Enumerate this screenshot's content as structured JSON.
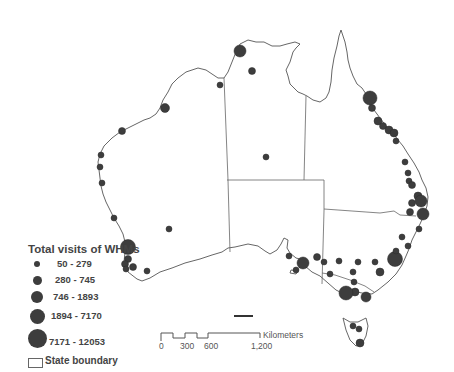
{
  "map": {
    "region": "Australia",
    "colors": {
      "symbol": "#3d3d3d",
      "outline": "#555555",
      "background": "#ffffff"
    }
  },
  "legend": {
    "title": "Total visits of WHMs",
    "classes": [
      {
        "label": "50 - 279",
        "size": 6
      },
      {
        "label": "280 - 745",
        "size": 9
      },
      {
        "label": "746 - 1893",
        "size": 12
      },
      {
        "label": "1894 - 7170",
        "size": 15
      },
      {
        "label": "7171 - 12053",
        "size": 19
      }
    ],
    "state_boundary_label": "State boundary"
  },
  "scale_bar": {
    "unit": "Kilometers",
    "ticks": [
      "0",
      "300",
      "600",
      "1,200"
    ]
  },
  "points": [
    {
      "x": 240,
      "y": 51,
      "r": 6
    },
    {
      "x": 252,
      "y": 71,
      "r": 3.5
    },
    {
      "x": 220,
      "y": 85,
      "r": 3
    },
    {
      "x": 165,
      "y": 108,
      "r": 4.5
    },
    {
      "x": 122,
      "y": 131,
      "r": 3.5
    },
    {
      "x": 101,
      "y": 155,
      "r": 3
    },
    {
      "x": 100,
      "y": 167,
      "r": 3
    },
    {
      "x": 102,
      "y": 183,
      "r": 3
    },
    {
      "x": 114,
      "y": 218,
      "r": 3
    },
    {
      "x": 169,
      "y": 229,
      "r": 3
    },
    {
      "x": 128,
      "y": 247,
      "r": 7.5
    },
    {
      "x": 128,
      "y": 259,
      "r": 3.5
    },
    {
      "x": 125,
      "y": 264,
      "r": 3.5
    },
    {
      "x": 133,
      "y": 267,
      "r": 3.5
    },
    {
      "x": 126,
      "y": 269,
      "r": 3
    },
    {
      "x": 147,
      "y": 271,
      "r": 3
    },
    {
      "x": 266,
      "y": 157,
      "r": 3
    },
    {
      "x": 370,
      "y": 98,
      "r": 7
    },
    {
      "x": 372,
      "y": 108,
      "r": 3.5
    },
    {
      "x": 378,
      "y": 121,
      "r": 4
    },
    {
      "x": 383,
      "y": 126,
      "r": 3.5
    },
    {
      "x": 389,
      "y": 130,
      "r": 4
    },
    {
      "x": 394,
      "y": 133,
      "r": 4
    },
    {
      "x": 396,
      "y": 141,
      "r": 3
    },
    {
      "x": 405,
      "y": 162,
      "r": 3
    },
    {
      "x": 408,
      "y": 173,
      "r": 3
    },
    {
      "x": 409,
      "y": 181,
      "r": 3
    },
    {
      "x": 412,
      "y": 185,
      "r": 3.5
    },
    {
      "x": 418,
      "y": 196,
      "r": 4
    },
    {
      "x": 421,
      "y": 201,
      "r": 6
    },
    {
      "x": 412,
      "y": 203,
      "r": 3.5
    },
    {
      "x": 423,
      "y": 214,
      "r": 6
    },
    {
      "x": 410,
      "y": 212,
      "r": 3.5
    },
    {
      "x": 419,
      "y": 229,
      "r": 3
    },
    {
      "x": 402,
      "y": 237,
      "r": 3
    },
    {
      "x": 408,
      "y": 246,
      "r": 3
    },
    {
      "x": 303,
      "y": 263,
      "r": 6
    },
    {
      "x": 296,
      "y": 270,
      "r": 3
    },
    {
      "x": 289,
      "y": 256,
      "r": 3
    },
    {
      "x": 317,
      "y": 257,
      "r": 3.5
    },
    {
      "x": 324,
      "y": 262,
      "r": 3
    },
    {
      "x": 339,
      "y": 261,
      "r": 3
    },
    {
      "x": 330,
      "y": 274,
      "r": 3
    },
    {
      "x": 353,
      "y": 272,
      "r": 3
    },
    {
      "x": 354,
      "y": 282,
      "r": 3
    },
    {
      "x": 355,
      "y": 292,
      "r": 4
    },
    {
      "x": 358,
      "y": 262,
      "r": 3
    },
    {
      "x": 375,
      "y": 262,
      "r": 3
    },
    {
      "x": 380,
      "y": 272,
      "r": 4
    },
    {
      "x": 395,
      "y": 259,
      "r": 7.5
    },
    {
      "x": 396,
      "y": 251,
      "r": 3
    },
    {
      "x": 346,
      "y": 293,
      "r": 7
    },
    {
      "x": 366,
      "y": 297,
      "r": 5
    },
    {
      "x": 353,
      "y": 326,
      "r": 3
    },
    {
      "x": 359,
      "y": 329,
      "r": 3
    },
    {
      "x": 360,
      "y": 343,
      "r": 4
    }
  ]
}
